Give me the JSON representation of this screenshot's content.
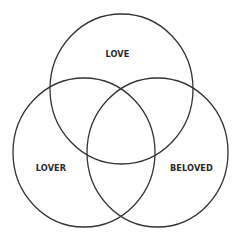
{
  "diagram": {
    "type": "venn",
    "stroke_color": "#333333",
    "text_color": "#2a2a2a",
    "background": "#ffffff",
    "sets": [
      {
        "id": "love",
        "label": "LOVE",
        "cx": 121.5,
        "cy": 89,
        "rx": 71.5,
        "ry": 75,
        "label_x": 117.5,
        "label_y": 54
      },
      {
        "id": "lover",
        "label": "LOVER",
        "cx": 84,
        "cy": 152.5,
        "rx": 71,
        "ry": 74.5,
        "label_x": 51,
        "label_y": 168
      },
      {
        "id": "beloved",
        "label": "BELOVED",
        "cx": 157.5,
        "cy": 152.5,
        "rx": 70.5,
        "ry": 74.5,
        "label_x": 191.5,
        "label_y": 168
      }
    ]
  }
}
